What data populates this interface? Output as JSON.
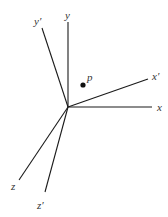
{
  "diagram": {
    "type": "coordinate-axes-rotation",
    "origin": {
      "x": 68,
      "y": 107
    },
    "stroke_color": "#1a1a1a",
    "label_color": "#333333",
    "axes": [
      {
        "id": "y",
        "label": "y",
        "end": {
          "x": 68,
          "y": 22
        },
        "label_pos": {
          "x": 65,
          "y": 19
        }
      },
      {
        "id": "y-prime",
        "label": "y′",
        "end": {
          "x": 42,
          "y": 28
        },
        "label_pos": {
          "x": 34,
          "y": 25
        }
      },
      {
        "id": "x",
        "label": "x",
        "end": {
          "x": 152,
          "y": 107
        },
        "label_pos": {
          "x": 157,
          "y": 111
        }
      },
      {
        "id": "x-prime",
        "label": "x′",
        "end": {
          "x": 148,
          "y": 79
        },
        "label_pos": {
          "x": 152,
          "y": 80
        }
      },
      {
        "id": "z",
        "label": "z",
        "end": {
          "x": 19,
          "y": 180
        },
        "label_pos": {
          "x": 11,
          "y": 190
        }
      },
      {
        "id": "z-prime",
        "label": "z′",
        "end": {
          "x": 45,
          "y": 192
        },
        "label_pos": {
          "x": 37,
          "y": 209
        }
      }
    ],
    "point": {
      "label": "p",
      "x": 83,
      "y": 85,
      "label_pos": {
        "x": 87,
        "y": 81
      }
    }
  }
}
